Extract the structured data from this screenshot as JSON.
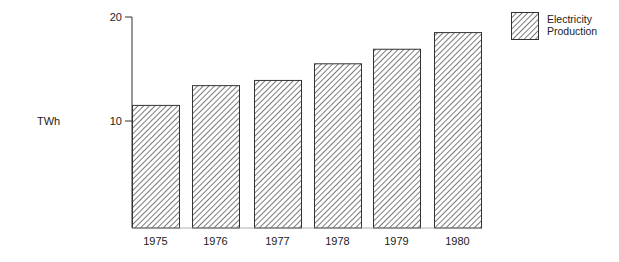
{
  "chart_data": {
    "type": "bar",
    "title": "",
    "xlabel": "",
    "ylabel": "TWh",
    "categories": [
      "1975",
      "1976",
      "1977",
      "1978",
      "1979",
      "1980"
    ],
    "series": [
      {
        "name": "Electricity Production",
        "values": [
          11.5,
          13.4,
          13.9,
          15.5,
          16.9,
          18.5
        ]
      }
    ],
    "ylim": [
      0,
      20
    ],
    "yticks": [
      10,
      20
    ],
    "grid": false,
    "legend_position": "top-right",
    "fill_pattern": "diagonal-hatch"
  },
  "legend": {
    "line1": "Electricity",
    "line2": "Production"
  },
  "colors": {
    "stroke": "#333333",
    "hatch": "#333333",
    "background": "#ffffff"
  }
}
